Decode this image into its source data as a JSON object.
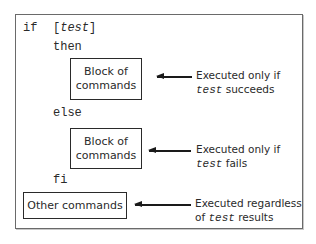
{
  "diagram": {
    "code": {
      "if_kw": "if",
      "test_open": "[",
      "test_word": "test",
      "test_close": "]",
      "then_kw": "then",
      "else_kw": "else",
      "fi_kw": "fi"
    },
    "boxes": [
      {
        "line1": "Block of",
        "line2": "commands"
      },
      {
        "line1": "Block of",
        "line2": "commands"
      },
      {
        "label": "Other commands"
      }
    ],
    "notes": [
      {
        "line1": "Executed only if",
        "mono": "test",
        "rest": " succeeds"
      },
      {
        "line1": "Executed only if",
        "mono": "test",
        "rest": " fails"
      },
      {
        "line1": "Executed regardless",
        "prefix": "of ",
        "mono": "test",
        "rest": " results"
      }
    ]
  }
}
